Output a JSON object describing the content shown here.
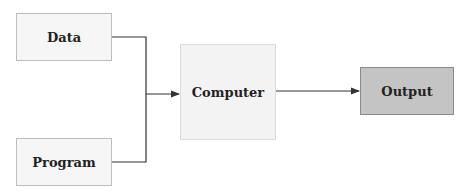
{
  "diagram": {
    "nodes": [
      {
        "id": "data",
        "label": "Data"
      },
      {
        "id": "program",
        "label": "Program"
      },
      {
        "id": "computer",
        "label": "Computer"
      },
      {
        "id": "output",
        "label": "Output"
      }
    ],
    "edges": [
      {
        "from": "data",
        "to": "computer"
      },
      {
        "from": "program",
        "to": "computer"
      },
      {
        "from": "computer",
        "to": "output"
      }
    ],
    "colors": {
      "line": "#333333",
      "output_fill": "#c4c4c4",
      "box_fill": "#f6f6f6"
    }
  }
}
